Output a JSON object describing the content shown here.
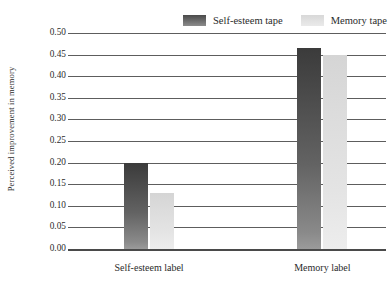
{
  "chart_data": {
    "type": "bar",
    "title": "",
    "subtitle": "",
    "xlabel": "",
    "ylabel": "Perceived improvement in memory",
    "categories": [
      "Self-esteem label",
      "Memory label"
    ],
    "series": [
      {
        "name": "Self-esteem tape",
        "color": "#4a4a4a",
        "values": [
          0.2,
          0.465
        ]
      },
      {
        "name": "Memory tape",
        "color": "#e0e0e0",
        "values": [
          0.13,
          0.45
        ]
      }
    ],
    "ylim": [
      0.0,
      0.5
    ],
    "ytick_step": 0.05,
    "ytick_labels": [
      "0.00",
      "0.05",
      "0.10",
      "0.15",
      "0.20",
      "0.25",
      "0.30",
      "0.35",
      "0.40",
      "0.45",
      "0.50"
    ],
    "ytick_values": [
      0.0,
      0.05,
      0.1,
      0.15,
      0.2,
      0.25,
      0.3,
      0.35,
      0.4,
      0.45,
      0.5
    ],
    "grid": "horizontal",
    "legend_position": "top-right",
    "annotations": []
  },
  "legend": {
    "entries": [
      {
        "label": "Self-esteem tape",
        "swatch": "dark"
      },
      {
        "label": "Memory tape",
        "swatch": "light"
      }
    ]
  },
  "axes": {
    "y_title": "Perceived improvement in memory"
  }
}
